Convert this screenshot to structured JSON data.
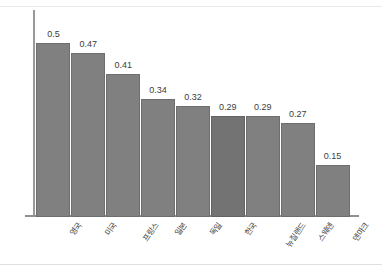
{
  "chart_data": {
    "type": "bar",
    "title": "",
    "subtitle": "",
    "xlabel": "",
    "ylabel": "",
    "categories": [
      "영국",
      "미국",
      "프랑스",
      "일본",
      "독일",
      "한국",
      "뉴질랜드",
      "스웨덴",
      "덴마크"
    ],
    "values": [
      0.5,
      0.47,
      0.41,
      0.34,
      0.32,
      0.29,
      0.29,
      0.27,
      0.15
    ],
    "value_labels": [
      "0.5",
      "0.47",
      "0.41",
      "0.34",
      "0.32",
      "0.29",
      "0.29",
      "0.27",
      "0.15"
    ],
    "ylim": [
      0,
      0.54
    ],
    "grid": false,
    "legend": null,
    "legend_position": "none",
    "highlight_index": 5,
    "colors": {
      "bar": "#808080",
      "bar_border": "#6e6e6e",
      "bar_highlight": "#737373",
      "bar_highlight_border": "#636363",
      "axis": "#8f8f8f",
      "text": "#3d3d3d",
      "background": "#ffffff",
      "frame_border": "#e4e4e4"
    }
  }
}
